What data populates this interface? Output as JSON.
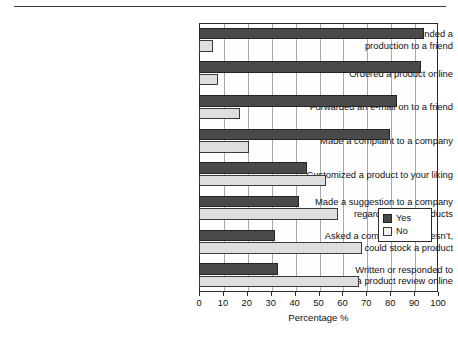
{
  "chart_data": {
    "type": "bar",
    "orientation": "horizontal",
    "title": "",
    "xlabel": "Percentage %",
    "ylabel": "",
    "xlim": [
      0,
      100
    ],
    "xticks": [
      0,
      10,
      20,
      30,
      40,
      50,
      60,
      70,
      80,
      90,
      100
    ],
    "grid": true,
    "legend_position": "center-right inside plot",
    "categories": [
      "Recommended a\nproduction to a friend",
      "Ordered a product online",
      "Forwarded an e-mail on to a friend",
      "Made a complaint to a company",
      "Customized a product to your liking",
      "Made a suggestion to a company\nregarding their products",
      "Asked a company that doesn’t,\nwhether they could stock a product",
      "Written or responded to\na product review online"
    ],
    "series": [
      {
        "name": "Yes",
        "color": "#4a4a4a",
        "values": [
          94,
          93,
          83,
          80,
          45,
          42,
          32,
          33
        ]
      },
      {
        "name": "No",
        "color": "#dedede",
        "values": [
          6,
          8,
          17,
          21,
          53,
          58,
          68,
          67
        ]
      }
    ]
  },
  "legend": {
    "entries": [
      {
        "label": "Yes",
        "swatch": "dark-filled-square"
      },
      {
        "label": "No",
        "swatch": "light-filled-square"
      }
    ]
  },
  "axis": {
    "x_title": "Percentage %",
    "tick_labels": [
      "0",
      "10",
      "20",
      "30",
      "40",
      "50",
      "60",
      "70",
      "80",
      "90",
      "100"
    ]
  }
}
